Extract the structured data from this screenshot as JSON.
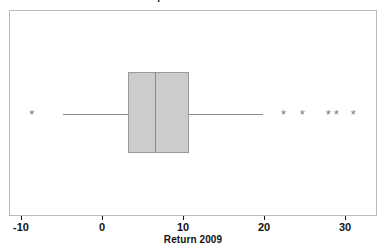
{
  "chart_data": {
    "type": "boxplot",
    "title": "Boxplot of Return 2009",
    "xlabel": "Return 2009",
    "ylabel": "",
    "orientation": "horizontal",
    "grid": false,
    "legend": false,
    "xlim": [
      -11.5,
      34.0
    ],
    "xticks": [
      -10,
      0,
      10,
      20,
      30
    ],
    "xtick_labels": [
      "-10",
      "0",
      "10",
      "20",
      "30"
    ],
    "series": [
      {
        "name": "Return 2009",
        "q1": 3.1,
        "median": 6.4,
        "q3": 10.6,
        "whisker_low": -4.9,
        "whisker_high": 19.8,
        "outliers": [
          -8.8,
          22.3,
          24.6,
          27.8,
          28.8,
          30.9
        ]
      }
    ]
  },
  "chart": {
    "title": "Boxplot of Return 2009",
    "xlabel": "Return 2009",
    "ticks": [
      {
        "value": -10,
        "label": "-10"
      },
      {
        "value": 0,
        "label": "0"
      },
      {
        "value": 10,
        "label": "10"
      },
      {
        "value": 20,
        "label": "20"
      },
      {
        "value": 30,
        "label": "30"
      }
    ],
    "colors": {
      "box_fill": "#cccccc",
      "box_border": "#9a9a9a",
      "whisker": "#8a8a8a",
      "frame": "#b9b9b9",
      "outlier": "#7a7a7a",
      "text": "#111111",
      "background": "#ffffff"
    },
    "outlier_glyph": "*"
  }
}
